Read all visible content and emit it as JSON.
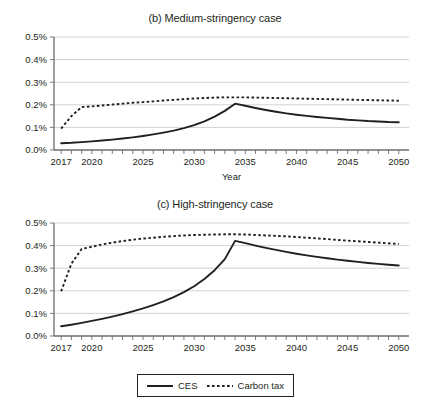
{
  "figure": {
    "background": "#ffffff",
    "line_color": "#231f20",
    "grid_color": "#bcbec0"
  },
  "legend": {
    "items": [
      {
        "label": "CES",
        "style": "solid",
        "icon": "solid-line-icon"
      },
      {
        "label": "Carbon tax",
        "style": "dotted",
        "icon": "dotted-line-icon"
      }
    ]
  },
  "chart_data": [
    {
      "type": "line",
      "id": "medium-stringency",
      "title": "(b) Medium-stringency case",
      "xlabel": "Year",
      "ylabel": "",
      "xlim": [
        2016.3,
        2051
      ],
      "ylim": [
        0.0,
        0.5
      ],
      "grid": true,
      "legend_position": "below-figure",
      "ytick_labels": [
        "0.0%",
        "0.1%",
        "0.2%",
        "0.3%",
        "0.4%",
        "0.5%"
      ],
      "ytick_values": [
        0.0,
        0.1,
        0.2,
        0.3,
        0.4,
        0.5
      ],
      "xtick_labels": [
        "2017",
        "2020",
        "2025",
        "2030",
        "2035",
        "2040",
        "2045",
        "2050"
      ],
      "xtick_values": [
        2017,
        2020,
        2025,
        2030,
        2035,
        2040,
        2045,
        2050
      ],
      "x": [
        2017,
        2018,
        2019,
        2020,
        2021,
        2022,
        2023,
        2024,
        2025,
        2026,
        2027,
        2028,
        2029,
        2030,
        2031,
        2032,
        2033,
        2034,
        2035,
        2036,
        2037,
        2038,
        2039,
        2040,
        2041,
        2042,
        2043,
        2044,
        2045,
        2046,
        2047,
        2048,
        2049,
        2050
      ],
      "series": [
        {
          "name": "CES",
          "style": "solid",
          "values": [
            0.03,
            0.032,
            0.035,
            0.038,
            0.042,
            0.046,
            0.051,
            0.056,
            0.062,
            0.069,
            0.077,
            0.086,
            0.097,
            0.11,
            0.127,
            0.148,
            0.173,
            0.205,
            0.196,
            0.186,
            0.177,
            0.169,
            0.162,
            0.156,
            0.151,
            0.146,
            0.142,
            0.138,
            0.134,
            0.131,
            0.128,
            0.126,
            0.124,
            0.123
          ]
        },
        {
          "name": "Carbon tax",
          "style": "dotted",
          "values": [
            0.095,
            0.15,
            0.19,
            0.193,
            0.197,
            0.201,
            0.205,
            0.209,
            0.212,
            0.215,
            0.219,
            0.222,
            0.225,
            0.228,
            0.23,
            0.232,
            0.233,
            0.233,
            0.233,
            0.232,
            0.231,
            0.23,
            0.229,
            0.228,
            0.227,
            0.226,
            0.225,
            0.224,
            0.223,
            0.222,
            0.221,
            0.22,
            0.219,
            0.218
          ]
        }
      ]
    },
    {
      "type": "line",
      "id": "high-stringency",
      "title": "(c) High-stringency case",
      "xlabel": "Year",
      "ylabel": "",
      "xlim": [
        2016.3,
        2051
      ],
      "ylim": [
        0.0,
        0.5
      ],
      "grid": true,
      "legend_position": "below-figure",
      "ytick_labels": [
        "0.0%",
        "0.1%",
        "0.2%",
        "0.3%",
        "0.4%",
        "0.5%"
      ],
      "ytick_values": [
        0.0,
        0.1,
        0.2,
        0.3,
        0.4,
        0.5
      ],
      "xtick_labels": [
        "2017",
        "2020",
        "2025",
        "2030",
        "2035",
        "2040",
        "2045",
        "2050"
      ],
      "xtick_values": [
        2017,
        2020,
        2025,
        2030,
        2035,
        2040,
        2045,
        2050
      ],
      "x": [
        2017,
        2018,
        2019,
        2020,
        2021,
        2022,
        2023,
        2024,
        2025,
        2026,
        2027,
        2028,
        2029,
        2030,
        2031,
        2032,
        2033,
        2034,
        2035,
        2036,
        2037,
        2038,
        2039,
        2040,
        2041,
        2042,
        2043,
        2044,
        2045,
        2046,
        2047,
        2048,
        2049,
        2050
      ],
      "series": [
        {
          "name": "CES",
          "style": "solid",
          "values": [
            0.043,
            0.05,
            0.058,
            0.067,
            0.076,
            0.086,
            0.097,
            0.109,
            0.122,
            0.137,
            0.153,
            0.172,
            0.194,
            0.22,
            0.252,
            0.291,
            0.34,
            0.421,
            0.411,
            0.4,
            0.39,
            0.381,
            0.372,
            0.364,
            0.357,
            0.35,
            0.344,
            0.338,
            0.333,
            0.328,
            0.323,
            0.319,
            0.315,
            0.312
          ]
        },
        {
          "name": "Carbon tax",
          "style": "dotted",
          "values": [
            0.198,
            0.32,
            0.385,
            0.395,
            0.405,
            0.413,
            0.42,
            0.426,
            0.431,
            0.435,
            0.439,
            0.442,
            0.445,
            0.447,
            0.448,
            0.449,
            0.45,
            0.45,
            0.449,
            0.447,
            0.445,
            0.443,
            0.441,
            0.438,
            0.435,
            0.432,
            0.429,
            0.425,
            0.422,
            0.419,
            0.416,
            0.413,
            0.41,
            0.407
          ]
        }
      ]
    }
  ]
}
